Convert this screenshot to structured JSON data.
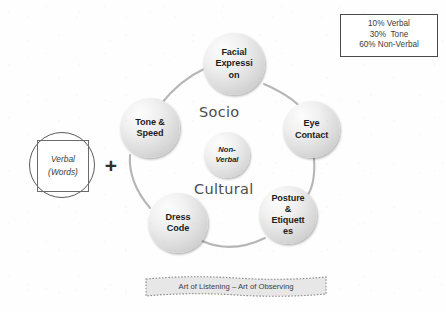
{
  "legend": {
    "lines": [
      "10% Verbal",
      "30%  Tone",
      "60% Non-Verbal"
    ]
  },
  "verbal": {
    "line1": "Verbal",
    "line2": "(Words)"
  },
  "operator": {
    "plus": "+"
  },
  "ring": {
    "inner_label": "Non-\nVerbal",
    "word_top": "Socio",
    "word_bottom": "Cultural",
    "nodes": [
      {
        "id": "facial",
        "label": "Facial\nExpressi\non"
      },
      {
        "id": "eye",
        "label": "Eye\nContact"
      },
      {
        "id": "posture",
        "label": "Posture\n&\nEtiquett\nes"
      },
      {
        "id": "dress",
        "label": "Dress\nCode"
      },
      {
        "id": "tone",
        "label": "Tone &\nSpeed"
      }
    ]
  },
  "banner": {
    "text": "Art of Listening – Art of Observing"
  },
  "colors": {
    "background": "#fefefe",
    "node_fill_light": "#fdfdfd",
    "node_fill_dark": "#bdbdbd",
    "ring_stroke": "#b4b4b4",
    "text_dark": "#1d1d1d",
    "word_gray": "#4c4c4c",
    "banner_fill": "#e6e6e6",
    "banner_border": "#8c8c8c",
    "legend_border": "#4a4a4a"
  }
}
